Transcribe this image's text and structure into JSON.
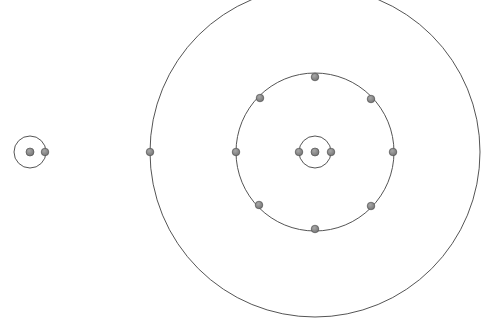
{
  "diagram": {
    "type": "bohr-atom-models",
    "colors": {
      "orbit": "#555555",
      "electron": "#777777",
      "electron_stroke": "#444444",
      "background": "#ffffff"
    },
    "atoms": [
      {
        "name": "small-atom",
        "center": [
          30,
          152
        ],
        "nucleus_r": 4,
        "shells": [
          {
            "r": 16,
            "electrons": [
              [
                45,
                152
              ]
            ]
          }
        ]
      },
      {
        "name": "large-atom",
        "center": [
          315,
          152
        ],
        "nucleus_r": 4,
        "shells": [
          {
            "r": 16,
            "electrons": [
              [
                299,
                152
              ],
              [
                331,
                152
              ]
            ]
          },
          {
            "r": 79,
            "electrons": [
              [
                315,
                77
              ],
              [
                371,
                99
              ],
              [
                393,
                152
              ],
              [
                371,
                206
              ],
              [
                315,
                229
              ],
              [
                259,
                205
              ],
              [
                236,
                152
              ],
              [
                260,
                98
              ]
            ]
          },
          {
            "r": 165,
            "electrons": [
              [
                150,
                152
              ]
            ]
          }
        ]
      }
    ]
  }
}
